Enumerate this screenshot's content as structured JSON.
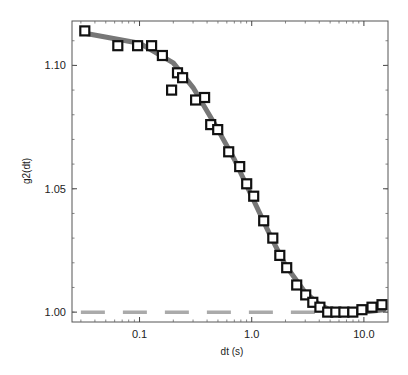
{
  "chart_data": {
    "type": "scatter",
    "title": "",
    "xlabel": "dt (s)",
    "ylabel": "g2(dt)",
    "xscale": "log",
    "xlim": [
      0.025,
      16.4
    ],
    "ylim": [
      0.996,
      1.118
    ],
    "grid": false,
    "legend": null,
    "x_ticks": [
      {
        "value": 0.1,
        "label": "0.1"
      },
      {
        "value": 1.0,
        "label": "1.0"
      },
      {
        "value": 10.0,
        "label": "10.0"
      }
    ],
    "y_ticks": [
      {
        "value": 1.0,
        "label": "1.00"
      },
      {
        "value": 1.05,
        "label": "1.05"
      },
      {
        "value": 1.1,
        "label": "1.10"
      }
    ],
    "series": [
      {
        "name": "data",
        "type": "scatter",
        "marker": "open-square",
        "color": "#111111",
        "x": [
          0.0325,
          0.064,
          0.096,
          0.128,
          0.16,
          0.193,
          0.218,
          0.242,
          0.316,
          0.38,
          0.431,
          0.497,
          0.623,
          0.781,
          0.902,
          1.042,
          1.28,
          1.54,
          1.78,
          2.05,
          2.52,
          3.03,
          3.5,
          4.05,
          4.76,
          5.62,
          6.63,
          7.97,
          9.59,
          11.8,
          14.5
        ],
        "y": [
          1.114,
          1.108,
          1.108,
          1.108,
          1.104,
          1.09,
          1.097,
          1.095,
          1.086,
          1.087,
          1.076,
          1.074,
          1.065,
          1.059,
          1.052,
          1.047,
          1.037,
          1.03,
          1.023,
          1.018,
          1.011,
          1.007,
          1.004,
          1.002,
          1.0,
          1.0,
          1.0,
          1.0,
          1.001,
          1.002,
          1.003
        ]
      },
      {
        "name": "fit",
        "type": "line",
        "color": "#777777",
        "x": [
          0.0325,
          0.1,
          0.2,
          0.3,
          0.5,
          0.7,
          1.0,
          1.5,
          2.0,
          3.0,
          4.0,
          5.0,
          7.0,
          10.0,
          15.0
        ],
        "y": [
          1.113,
          1.109,
          1.101,
          1.091,
          1.074,
          1.062,
          1.047,
          1.03,
          1.019,
          1.008,
          1.003,
          1.001,
          1.0,
          1.0,
          1.001
        ]
      },
      {
        "name": "baseline",
        "type": "line",
        "style": "dashed",
        "color": "#aaaaaa",
        "x": [
          0.03,
          4.0
        ],
        "y": [
          1.0,
          1.0
        ]
      }
    ]
  }
}
